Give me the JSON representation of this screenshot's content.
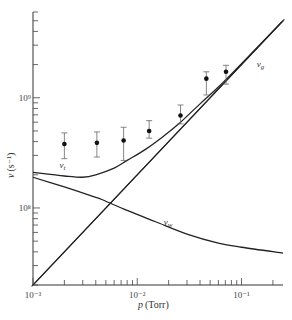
{
  "chart_data": {
    "type": "line",
    "title": "",
    "xlabel": "p (Torr)",
    "ylabel": "ν (s⁻¹)",
    "xscale": "log",
    "yscale": "log",
    "xlim": [
      0.001,
      0.25
    ],
    "ylim": [
      20000000,
      6000000000
    ],
    "grid": false,
    "x_ticks": [
      {
        "value": 0.001,
        "label": "10⁻³"
      },
      {
        "value": 0.01,
        "label": "10⁻²"
      },
      {
        "value": 0.1,
        "label": "10⁻¹"
      }
    ],
    "y_ticks": [
      {
        "value": 100000000,
        "label": "10⁸"
      },
      {
        "value": 1000000000,
        "label": "10⁹"
      }
    ],
    "series": [
      {
        "name": "ν_g",
        "label": "νg",
        "kind": "line",
        "double_line": true,
        "x": [
          0.001,
          0.25
        ],
        "y": [
          20000000,
          5000000000
        ]
      },
      {
        "name": "ν_w",
        "label": "νw",
        "kind": "line",
        "x": [
          0.001,
          0.002,
          0.004,
          0.0045,
          0.008,
          0.015,
          0.03,
          0.06,
          0.1,
          0.25
        ],
        "y": [
          190000000,
          155000000,
          125000000,
          120000000,
          95000000,
          75000000,
          58000000,
          48000000,
          44000000,
          39000000
        ]
      },
      {
        "name": "ν_t",
        "label": "νt",
        "kind": "line",
        "x": [
          0.001,
          0.002,
          0.003,
          0.004,
          0.006,
          0.008,
          0.012,
          0.018,
          0.025,
          0.04,
          0.06,
          0.1,
          0.25
        ],
        "y": [
          210000000,
          195000000,
          190000000,
          200000000,
          230000000,
          270000000,
          340000000,
          450000000,
          580000000,
          880000000,
          1250000000,
          2040000000,
          5000000000
        ]
      },
      {
        "name": "measured",
        "kind": "scatter",
        "x": [
          0.002,
          0.0041,
          0.0074,
          0.013,
          0.026,
          0.046,
          0.071
        ],
        "y": [
          380000000,
          390000000,
          410000000,
          500000000,
          690000000,
          1490000000,
          1720000000
        ],
        "y_err_high": [
          480000000,
          490000000,
          540000000,
          620000000,
          860000000,
          1720000000,
          1970000000
        ],
        "y_err_low": [
          280000000,
          290000000,
          270000000,
          430000000,
          580000000,
          1060000000,
          1330000000
        ]
      }
    ],
    "annotations": [
      {
        "text": "νt",
        "series": "ν_t",
        "x": 0.0018,
        "y": 230000000
      },
      {
        "text": "νw",
        "series": "ν_w",
        "x": 0.018,
        "y": 70000000
      },
      {
        "text": "νg",
        "series": "ν_g",
        "x": 0.14,
        "y": 1900000000
      }
    ]
  },
  "labels": {
    "xlabel_main": "p",
    "xlabel_unit": "(Torr)",
    "ylabel_main": "ν",
    "ylabel_unit": "(s⁻¹)",
    "nu_t_main": "ν",
    "nu_t_sub": "t",
    "nu_w_main": "ν",
    "nu_w_sub": "w",
    "nu_g_main": "ν",
    "nu_g_sub": "g"
  }
}
